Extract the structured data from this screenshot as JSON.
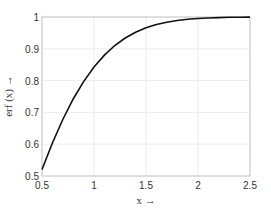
{
  "chart_data": {
    "type": "line",
    "title": "",
    "xlabel": "x →",
    "ylabel": "erf (x) →",
    "xlim": [
      0.5,
      2.5
    ],
    "ylim": [
      0.5,
      1.0
    ],
    "grid": true,
    "xticks": [
      "0.5",
      "1",
      "1.5",
      "2",
      "2.5"
    ],
    "yticks": [
      "0.5",
      "0.6",
      "0.7",
      "0.8",
      "0.9",
      "1"
    ],
    "series": [
      {
        "name": "erf(x)",
        "color": "#111111",
        "x": [
          0.5,
          0.6,
          0.7,
          0.8,
          0.9,
          1.0,
          1.1,
          1.2,
          1.3,
          1.4,
          1.5,
          1.6,
          1.7,
          1.8,
          1.9,
          2.0,
          2.1,
          2.2,
          2.3,
          2.4,
          2.5
        ],
        "y": [
          0.5205,
          0.6039,
          0.6778,
          0.7421,
          0.7969,
          0.8427,
          0.8802,
          0.9103,
          0.934,
          0.9523,
          0.9661,
          0.9763,
          0.9838,
          0.9891,
          0.9928,
          0.9953,
          0.997,
          0.9981,
          0.9989,
          0.9993,
          0.9996
        ]
      }
    ]
  }
}
